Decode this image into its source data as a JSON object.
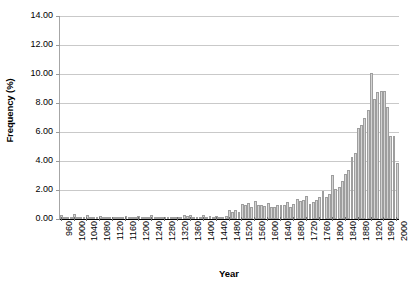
{
  "chart_data": {
    "type": "bar",
    "title": "",
    "xlabel": "Year",
    "ylabel": "Frequency (%)",
    "xlim": [
      955,
      2005
    ],
    "ylim": [
      0,
      14
    ],
    "ytick_step": 2.0,
    "grid": true,
    "legend": "none",
    "bin_width": 10,
    "bar_color": "#d4d4d4",
    "bar_border_color": "#9e9e9e",
    "gridline_color": "#c9c9c9",
    "axis_color": "#000000",
    "ytick_labels": [
      "14.00",
      "12.00",
      "10.00",
      "8.00",
      "6.00",
      "4.00",
      "2.00",
      "0.00"
    ],
    "ytick_values": [
      14.0,
      12.0,
      10.0,
      8.0,
      6.0,
      4.0,
      2.0,
      0.0
    ],
    "xtick_labels": [
      "960",
      "1000",
      "1040",
      "1080",
      "1120",
      "1160",
      "1200",
      "1240",
      "1280",
      "1320",
      "1360",
      "1400",
      "1440",
      "1480",
      "1520",
      "1560",
      "1600",
      "1640",
      "1680",
      "1720",
      "1760",
      "1800",
      "1840",
      "1880",
      "1920",
      "1960",
      "2000"
    ],
    "xtick_values": [
      960,
      1000,
      1040,
      1080,
      1120,
      1160,
      1200,
      1240,
      1280,
      1320,
      1360,
      1400,
      1440,
      1480,
      1520,
      1560,
      1600,
      1640,
      1680,
      1720,
      1760,
      1800,
      1840,
      1880,
      1920,
      1960,
      2000
    ],
    "categories": [
      960,
      970,
      980,
      990,
      1000,
      1010,
      1020,
      1030,
      1040,
      1050,
      1060,
      1070,
      1080,
      1090,
      1100,
      1110,
      1120,
      1130,
      1140,
      1150,
      1160,
      1170,
      1180,
      1190,
      1200,
      1210,
      1220,
      1230,
      1240,
      1250,
      1260,
      1270,
      1280,
      1290,
      1300,
      1310,
      1320,
      1330,
      1340,
      1350,
      1360,
      1370,
      1380,
      1390,
      1400,
      1410,
      1420,
      1430,
      1440,
      1450,
      1460,
      1470,
      1480,
      1490,
      1500,
      1510,
      1520,
      1530,
      1540,
      1550,
      1560,
      1570,
      1580,
      1590,
      1600,
      1610,
      1620,
      1630,
      1640,
      1650,
      1660,
      1670,
      1680,
      1690,
      1700,
      1710,
      1720,
      1730,
      1740,
      1750,
      1760,
      1770,
      1780,
      1790,
      1800,
      1810,
      1820,
      1830,
      1840,
      1850,
      1860,
      1870,
      1880,
      1890,
      1900,
      1910,
      1920,
      1930,
      1940,
      1950,
      1960,
      1970,
      1980,
      1990,
      2000
    ],
    "values": [
      0.3,
      0.1,
      0.05,
      0.1,
      0.35,
      0.15,
      0.1,
      0.1,
      0.25,
      0.1,
      0.05,
      0.1,
      0.2,
      0.05,
      0.1,
      0.05,
      0.15,
      0.1,
      0.1,
      0.05,
      0.2,
      0.15,
      0.1,
      0.1,
      0.2,
      0.1,
      0.15,
      0.1,
      0.25,
      0.1,
      0.1,
      0.05,
      0.15,
      0.05,
      0.1,
      0.05,
      0.1,
      0.05,
      0.3,
      0.2,
      0.25,
      0.1,
      0.15,
      0.1,
      0.25,
      0.1,
      0.2,
      0.15,
      0.2,
      0.1,
      0.15,
      0.2,
      0.6,
      0.45,
      0.6,
      0.5,
      1.05,
      0.95,
      1.1,
      0.85,
      1.25,
      1.0,
      0.95,
      0.9,
      1.1,
      0.85,
      0.8,
      1.0,
      1.0,
      0.95,
      1.15,
      0.8,
      1.05,
      1.4,
      1.25,
      1.3,
      1.6,
      1.05,
      1.15,
      1.3,
      1.55,
      1.9,
      1.5,
      1.7,
      3.05,
      2.05,
      2.2,
      2.6,
      3.1,
      3.35,
      4.25,
      4.55,
      6.3,
      6.45,
      7.0,
      7.55,
      10.1,
      8.3,
      8.75,
      8.85,
      8.85,
      7.7,
      5.75,
      5.7,
      3.85
    ]
  },
  "axis": {
    "x_title": "Year",
    "y_title": "Frequency (%)"
  }
}
